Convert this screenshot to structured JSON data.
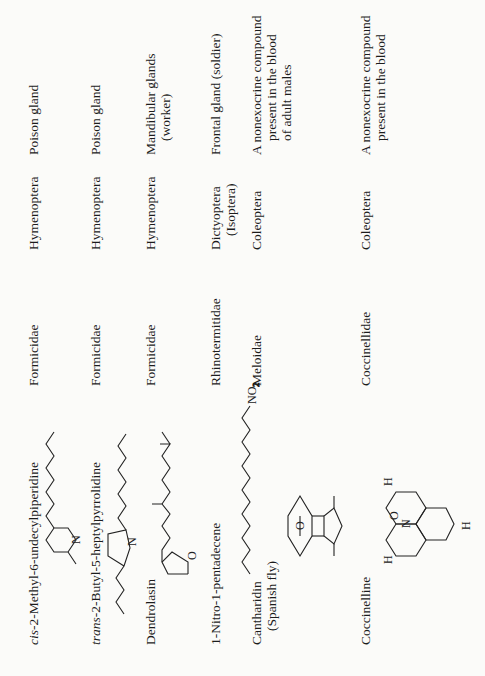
{
  "table": {
    "rows": [
      {
        "compound": "cis-2-Methyl-6-undecylpiperidine",
        "compound_prefix": "cis",
        "compound_rest": "-2-Methyl-6-undecylpiperidine",
        "structure": "piperidine-ring-with-undecyl-chain",
        "family": "Formicidae",
        "order": "Hymenoptera",
        "order_sub": "",
        "source": "Poison gland",
        "source_sub": ""
      },
      {
        "compound": "trans-2-Butyl-5-heptylpyrrolidine",
        "compound_prefix": "trans",
        "compound_rest": "-2-Butyl-5-heptylpyrrolidine",
        "structure": "pyrrolidine-ring-with-butyl-heptyl",
        "family": "Formicidae",
        "order": "Hymenoptera",
        "order_sub": "",
        "source": "Poison gland",
        "source_sub": ""
      },
      {
        "compound": "Dendrolasin",
        "structure": "furan-terpenoid-chain",
        "family": "Formicidae",
        "order": "Hymenoptera",
        "order_sub": "",
        "source": "Mandibular glands",
        "source_sub": "(worker)"
      },
      {
        "compound": "1-Nitro-1-pentadecene",
        "structure": "nitroalkene-chain",
        "structure_label": "NO",
        "structure_label_sub": "2",
        "family": "Rhinotermitidae",
        "order": "Dictyoptera",
        "order_sub": "(Isoptera)",
        "source": "Frontal gland (soldier)",
        "source_sub": ""
      },
      {
        "compound": "Cantharidin",
        "compound_sub": "(Spanish fly)",
        "structure": "cantharidin-bicyclic-anhydride",
        "structure_atoms": [
          "O",
          "O",
          "O",
          "O"
        ],
        "family": "Meloidae",
        "order": "Coleoptera",
        "order_sub": "",
        "source_lines": [
          "A nonexocrine compound",
          "present in the blood",
          "of adult males"
        ]
      },
      {
        "compound": "Coccinelline",
        "structure": "coccinelline-tricyclic-N-oxide",
        "structure_atoms": [
          "H",
          "H",
          "H",
          "N",
          "O"
        ],
        "family": "Coccinellidae",
        "order": "Coleoptera",
        "order_sub": "",
        "source_lines": [
          "A nonexocrine compound",
          "present in the blood"
        ]
      }
    ]
  }
}
